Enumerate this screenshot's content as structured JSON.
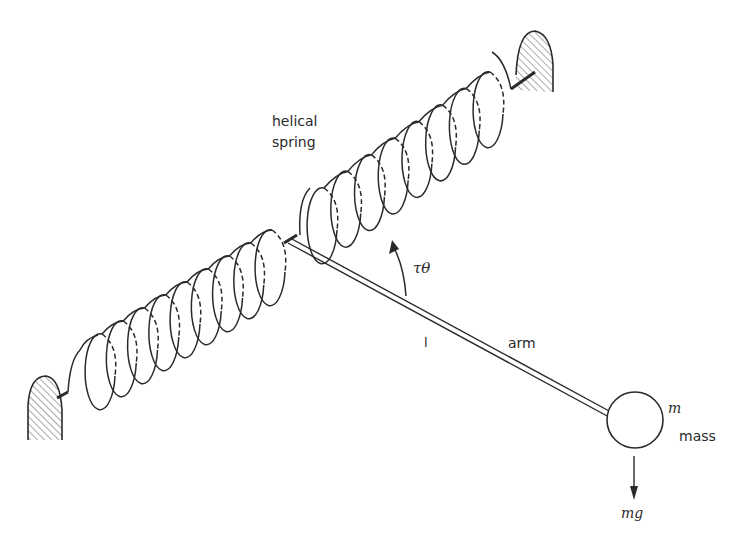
{
  "diagram": {
    "labels": {
      "spring_line1": "helical",
      "spring_line2": "spring",
      "torque": "τθ",
      "length": "l",
      "arm": "arm",
      "mass_symbol": "m",
      "mass": "mass",
      "weight": "mg"
    },
    "components": {
      "left_spring_coils": 9,
      "right_spring_coils": 8,
      "supports": [
        "left-wall-support",
        "right-wall-support"
      ]
    },
    "colors": {
      "ink": "#2a2a2a",
      "background": "#ffffff"
    }
  }
}
